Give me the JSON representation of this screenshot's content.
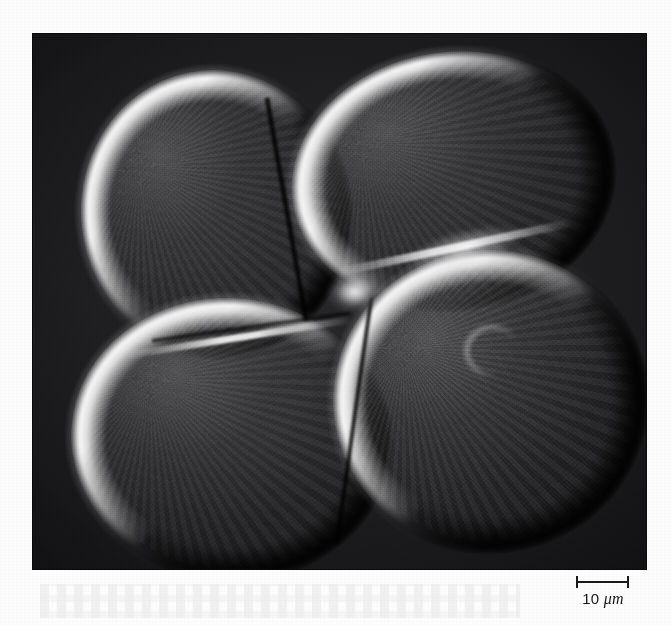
{
  "figure": {
    "kind": "micrograph",
    "modality": "differential-interference-contrast",
    "frame": {
      "x": 33,
      "y": 34,
      "width": 613,
      "height": 535
    },
    "page_background_color": "#fdfdfd",
    "field_background_color": "#0d0d0d"
  },
  "scale_bar": {
    "value": "10",
    "unit": "μm",
    "label": "10 μm",
    "bar_length_px": 53,
    "tick_color": "#1a1a1a",
    "position": "bottom-right"
  },
  "cells": [
    {
      "name": "blastomere-top-left",
      "x": 48,
      "y": 36,
      "width": 268,
      "height": 286,
      "rotation": -6,
      "highlight_side": "upper-left",
      "shadow_side": "lower-right"
    },
    {
      "name": "blastomere-top-right",
      "x": 258,
      "y": 18,
      "width": 322,
      "height": 256,
      "rotation": -8,
      "highlight_side": "upper-left",
      "shadow_side": "lower-right"
    },
    {
      "name": "blastomere-bottom-left",
      "x": 38,
      "y": 264,
      "width": 318,
      "height": 280,
      "rotation": 4,
      "highlight_side": "upper-left",
      "shadow_side": "lower-right"
    },
    {
      "name": "blastomere-bottom-right",
      "x": 300,
      "y": 216,
      "width": 312,
      "height": 300,
      "rotation": -3,
      "highlight_side": "upper-left",
      "shadow_side": "lower-right"
    }
  ],
  "nucleus": {
    "name": "nucleus-crescent",
    "in_cell": "blastomere-bottom-right",
    "x": 427,
    "y": 287,
    "width": 66,
    "height": 60
  },
  "furrows": [
    {
      "name": "furrow-vertical-top",
      "x": 250,
      "y": 62,
      "width": 7,
      "height": 226,
      "rotation": -10
    },
    {
      "name": "furrow-horizontal-mid",
      "x": 118,
      "y": 290,
      "width": 200,
      "height": 6,
      "rotation": -8
    },
    {
      "name": "furrow-diagonal-right",
      "x": 318,
      "y": 262,
      "width": 6,
      "height": 250,
      "rotation": 8
    }
  ],
  "colors": {
    "cell_highlight": "#fafafa",
    "cell_body": "#5e5e61",
    "shadow": "#000000",
    "field": "#202022",
    "paper": "#fdfdfd"
  }
}
